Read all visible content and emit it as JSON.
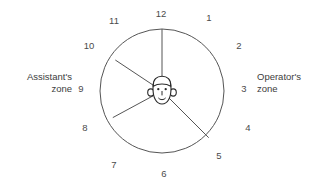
{
  "diagram": {
    "type": "clock-face-zone-diagram",
    "title": "",
    "background_color": "#ffffff",
    "stroke_color": "#555555",
    "text_color": "#4b4b4b",
    "center_icon": "person-head-icon",
    "circle": {
      "center_x": 162,
      "center_y": 91,
      "radius": 62
    },
    "clock_numbers": [
      {
        "label": "12",
        "hour": 12,
        "x": 161,
        "y": 14
      },
      {
        "label": "1",
        "hour": 1,
        "x": 209,
        "y": 18
      },
      {
        "label": "2",
        "hour": 2,
        "x": 239,
        "y": 46
      },
      {
        "label": "3",
        "hour": 3,
        "x": 244,
        "y": 89
      },
      {
        "label": "4",
        "hour": 4,
        "x": 248,
        "y": 128
      },
      {
        "label": "5",
        "hour": 5,
        "x": 219,
        "y": 156
      },
      {
        "label": "6",
        "hour": 6,
        "x": 164,
        "y": 174
      },
      {
        "label": "7",
        "hour": 7,
        "x": 114,
        "y": 165
      },
      {
        "label": "8",
        "hour": 8,
        "x": 85,
        "y": 128
      },
      {
        "label": "9",
        "hour": 9,
        "x": 81,
        "y": 89
      },
      {
        "label": "10",
        "hour": 10,
        "x": 89,
        "y": 46
      },
      {
        "label": "11",
        "hour": 11,
        "x": 114,
        "y": 21
      }
    ],
    "divider_lines": [
      {
        "name": "divider-to-12",
        "hour": 12
      },
      {
        "name": "divider-to-10",
        "hour": 10
      },
      {
        "name": "divider-to-8",
        "hour": 8
      },
      {
        "name": "divider-to-5",
        "hour": 5
      }
    ],
    "zones": {
      "left": {
        "name": "assistants-zone",
        "line1": "Assistant's",
        "line2": "zone"
      },
      "right": {
        "name": "operators-zone",
        "line1": "Operator's",
        "line2": "zone"
      }
    }
  }
}
